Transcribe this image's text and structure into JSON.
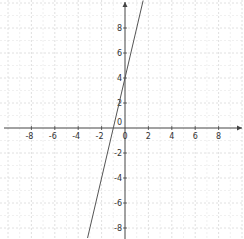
{
  "chart_data": {
    "type": "line",
    "title": "",
    "xlabel": "",
    "ylabel": "",
    "xlim": [
      -10.7,
      10.2
    ],
    "ylim": [
      -8.9,
      10.2
    ],
    "grid": true,
    "origin_label": "0",
    "x_ticks": [
      -8,
      -6,
      -4,
      -2,
      0,
      2,
      4,
      6,
      8
    ],
    "x_tick_labels": [
      "-8",
      "-6",
      "-4",
      "-2",
      "0",
      "2",
      "4",
      "6",
      "8"
    ],
    "y_ticks": [
      -8,
      -6,
      -4,
      -2,
      2,
      4,
      6,
      8
    ],
    "y_tick_labels": [
      "-8",
      "-6",
      "-4",
      "-2",
      "2",
      "4",
      "6",
      "8"
    ],
    "series": [
      {
        "name": "y = 4x + 4",
        "slope": 4,
        "intercept": 4,
        "x": [
          -3.2,
          1.55
        ],
        "y": [
          -8.8,
          10.2
        ],
        "color": "#555555"
      }
    ],
    "legend": []
  },
  "colors": {
    "axis": "#444444",
    "grid": "#d8d8d8",
    "line": "#555555",
    "background": "#ffffff"
  }
}
